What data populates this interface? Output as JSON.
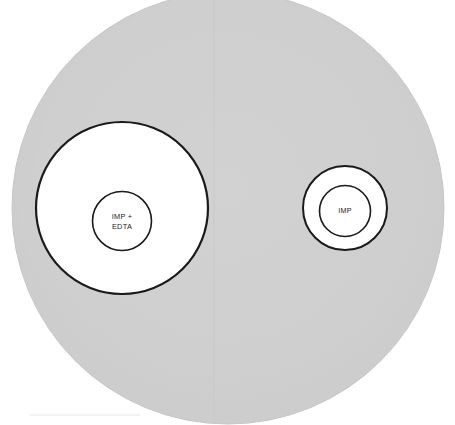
{
  "figure": {
    "name": "disc-diffusion-plate",
    "width": 455,
    "height": 425
  },
  "colors": {
    "agar_left": "#cfcfcf",
    "agar_right": "#d0d0d0",
    "agar_edge": "#c4c4c4",
    "zone_fill": "#ffffff",
    "zone_outline": "#1a1a1a",
    "disc_fill": "#ffffff",
    "disc_outline": "#1a1a1a",
    "label_text": "#1a1a1a",
    "background": "#ffffff"
  },
  "plate": {
    "label": "agar-plate",
    "cx": 228,
    "cy": 208,
    "r": 216,
    "seam_x": 214
  },
  "groups": [
    {
      "id": "left",
      "name": "imp-edta-disc-group",
      "zone": {
        "cx": 122,
        "cy": 208,
        "r": 86,
        "stroke_width": 2.2
      },
      "disc": {
        "cx": 122,
        "cy": 221,
        "r": 29.5,
        "stroke_width": 1.6
      },
      "label_lines": [
        "IMP +",
        "EDTA"
      ],
      "label_line1_y": 219,
      "label_line2_y": 229
    },
    {
      "id": "right",
      "name": "imp-disc-group",
      "zone": {
        "cx": 345,
        "cy": 208,
        "r": 42,
        "stroke_width": 2.0
      },
      "disc": {
        "cx": 345,
        "cy": 211,
        "r": 25.5,
        "stroke_width": 1.6
      },
      "label_lines": [
        "IMP"
      ],
      "label_line1_y": 213,
      "label_line2_y": 213
    }
  ],
  "labels": {
    "left_line1": "IMP +",
    "left_line2": "EDTA",
    "right_line1": "IMP"
  }
}
